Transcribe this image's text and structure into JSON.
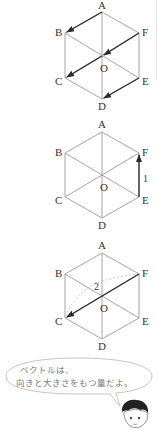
{
  "labels": {
    "A": "A",
    "B": "B",
    "C": "C",
    "D": "D",
    "E": "E",
    "F": "F",
    "O": "O"
  },
  "figures": [
    {
      "id": "hexagon-1",
      "description": "Regular hexagon ABCDEF with center O; parallel vectors AB, FO, OC, ED drawn as arrows",
      "vectors": [
        "A→B",
        "F→O",
        "O→C",
        "E→D"
      ]
    },
    {
      "id": "hexagon-2",
      "description": "Regular hexagon ABCDEF with center O; vector E→F with magnitude 1",
      "vectors": [
        "E→F"
      ],
      "magnitude_label": "1"
    },
    {
      "id": "hexagon-3",
      "description": "Regular hexagon ABCDEF with center O; vector F→C with magnitude 2, dashed arc",
      "vectors": [
        "F→C"
      ],
      "magnitude_label": "2"
    }
  ],
  "speech_bubble": {
    "line1": "ベクトルは、",
    "line2": "向きと大きさをもつ量だよ。"
  },
  "colors": {
    "edge": "#9a9a9a",
    "vector": "#2a2a2a",
    "text": "#333333",
    "bubble_text": "#777777"
  }
}
